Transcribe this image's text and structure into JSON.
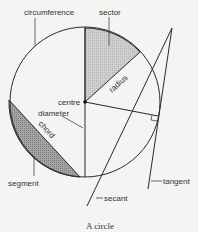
{
  "title": "A circle",
  "labels": {
    "circumference": "circumference",
    "sector": "sector",
    "radius": "radius",
    "centre": "centre",
    "diameter": "diameter",
    "chord": "chord",
    "segment": "segment",
    "secant": "secant",
    "tangent": "tangent"
  },
  "colors": {
    "sector_fill": "#c8c8c8",
    "segment_fill": "#9a9a9a",
    "line": "#2a2a2a"
  }
}
